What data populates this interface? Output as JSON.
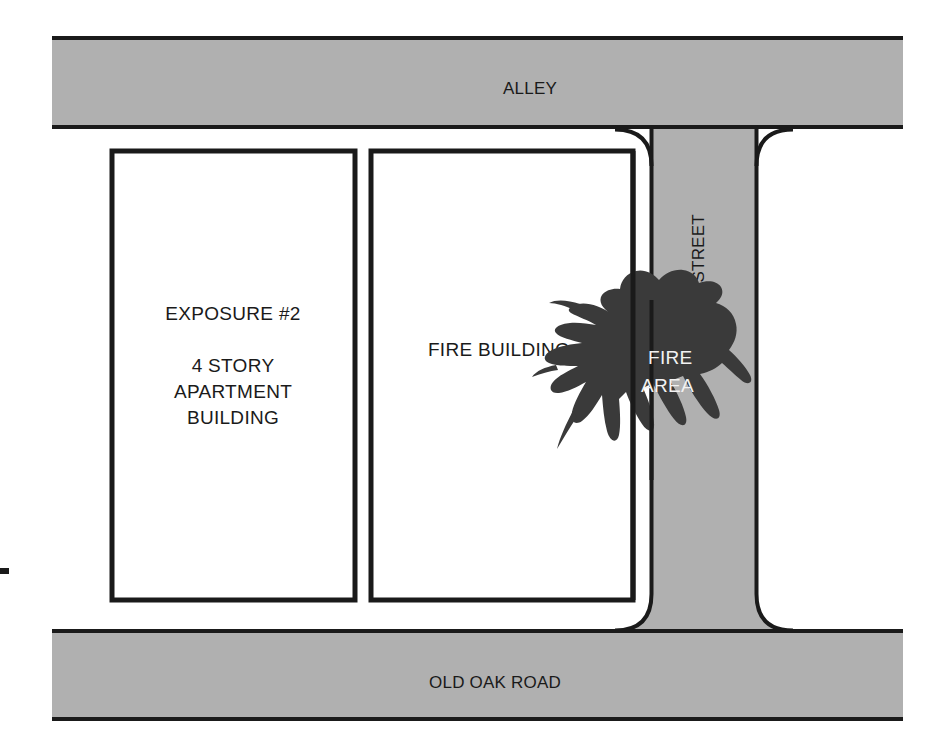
{
  "diagram": {
    "colors": {
      "pavement_gray": "#b0b0b0",
      "outline_black": "#1a1a1a",
      "fire_area_dark": "#3a3a3a",
      "background_white": "#ffffff",
      "label_white": "#f2f2f2"
    },
    "streets": [
      {
        "id": "alley",
        "label": "ALLEY",
        "orientation": "horizontal",
        "position": "top"
      },
      {
        "id": "old-oak-road",
        "label": "OLD OAK ROAD",
        "orientation": "horizontal",
        "position": "bottom"
      },
      {
        "id": "13th-street",
        "label": "13TH STREET",
        "orientation": "vertical",
        "position": "right-of-fire-building",
        "rotation": "-90"
      }
    ],
    "buildings": [
      {
        "id": "exposure-2",
        "lines": [
          "EXPOSURE #2",
          "4 STORY",
          "APARTMENT",
          "BUILDING"
        ],
        "label_main": "EXPOSURE #2",
        "label_detail_1": "4 STORY",
        "label_detail_2": "APARTMENT",
        "label_detail_3": "BUILDING"
      },
      {
        "id": "fire-building",
        "lines": [
          "FIRE BUILDING"
        ],
        "label_main": "FIRE BUILDING"
      }
    ],
    "fire_area": {
      "label_line_1": "FIRE",
      "label_line_2": "AREA",
      "description": "irregular dark flame shape spanning the fire building's right wall into 13th Street"
    }
  }
}
